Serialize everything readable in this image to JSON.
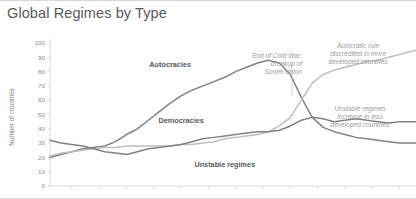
{
  "header": {
    "title": "Global Regimes by Type"
  },
  "chart_data": {
    "type": "line",
    "title": "Global Regimes by Type",
    "xlabel": "",
    "ylabel": "Number of countries",
    "ylim": [
      0,
      100
    ],
    "xlim": [
      1946,
      2013
    ],
    "yticks": [
      0,
      10,
      20,
      30,
      40,
      50,
      60,
      70,
      80,
      90,
      100
    ],
    "xticks": [
      1950,
      1955,
      1960,
      1965,
      1970,
      1975,
      1980,
      1985,
      1990,
      1995,
      2000,
      2005,
      2010
    ],
    "xtick_labels": [
      "",
      "",
      "",
      "",
      "",
      "",
      "",
      "",
      "",
      "",
      "",
      "",
      ""
    ],
    "grid": false,
    "legend": "inline-labels",
    "x": [
      1946,
      1948,
      1950,
      1952,
      1954,
      1956,
      1958,
      1960,
      1962,
      1964,
      1966,
      1968,
      1970,
      1972,
      1974,
      1976,
      1978,
      1980,
      1982,
      1984,
      1986,
      1988,
      1990,
      1992,
      1994,
      1996,
      1998,
      2000,
      2002,
      2004,
      2006,
      2008,
      2010,
      2012,
      2013
    ],
    "series": [
      {
        "name": "Autocracies",
        "color": "#808285",
        "label_x": 1968,
        "label_y": 83,
        "values": [
          20,
          22,
          24,
          26,
          27,
          28,
          31,
          36,
          40,
          46,
          52,
          58,
          63,
          67,
          70,
          73,
          76,
          80,
          83,
          86,
          88,
          86,
          78,
          62,
          48,
          41,
          38,
          36,
          34,
          33,
          32,
          31,
          30,
          30,
          30
        ]
      },
      {
        "name": "Democracies",
        "color": "#bcbec0",
        "label_x": 1970,
        "label_y": 44,
        "values": [
          21,
          23,
          24,
          25,
          26,
          27,
          27,
          28,
          28,
          28,
          28,
          28,
          29,
          29,
          30,
          31,
          33,
          34,
          35,
          36,
          38,
          42,
          48,
          60,
          72,
          78,
          81,
          83,
          85,
          87,
          88,
          90,
          92,
          94,
          95
        ]
      },
      {
        "name": "Unstable regimes",
        "color": "#808285",
        "label_x": 1978,
        "label_y": 13,
        "values": [
          32,
          30,
          29,
          28,
          26,
          24,
          23,
          22,
          24,
          26,
          27,
          28,
          29,
          31,
          33,
          34,
          35,
          36,
          37,
          38,
          38,
          39,
          42,
          46,
          48,
          47,
          45,
          46,
          47,
          46,
          45,
          44,
          45,
          45,
          45
        ]
      }
    ],
    "annotations": [
      {
        "name": "cold-war-annotation",
        "text": "End of Cold War;\nbreakup of\nSoviet Union",
        "align": "right",
        "x": 302,
        "y": 36
      },
      {
        "name": "autocratic-rule-annotation",
        "text": "Autocratic rule\ndiscredited in more\ndeveloped countries",
        "align": "center",
        "x": 358,
        "y": 26
      },
      {
        "name": "unstable-regimes-annotation",
        "text": "Unstable regimes\nincrease in less\ndeveloped countries",
        "align": "center",
        "x": 360,
        "y": 89
      }
    ]
  }
}
